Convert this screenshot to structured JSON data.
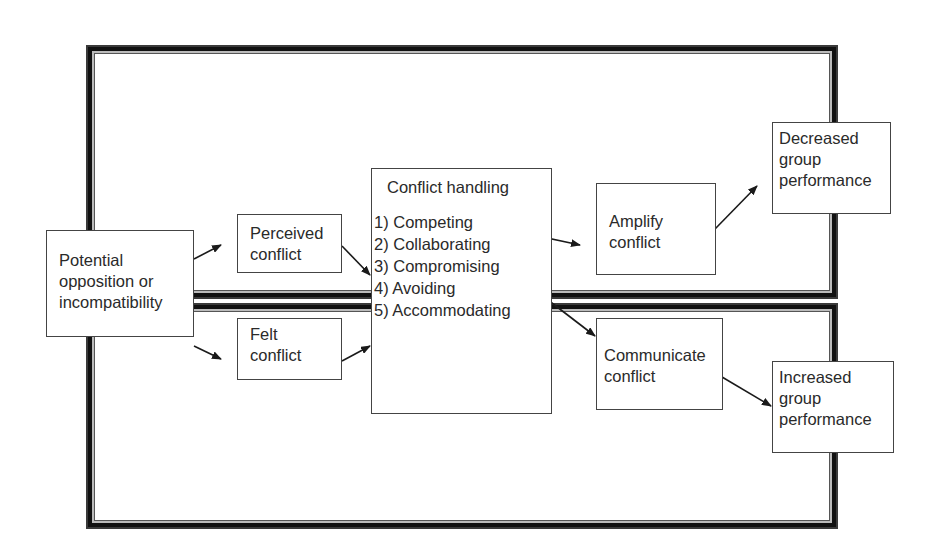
{
  "diagram": {
    "regions": [
      {
        "id": "top",
        "name": "dysfunctional-region"
      },
      {
        "id": "bottom",
        "name": "functional-region"
      }
    ],
    "nodes": {
      "potential": {
        "lines": [
          "Potential",
          "opposition or",
          "incompatibility"
        ]
      },
      "perceived": {
        "lines": [
          "Perceived",
          "conflict"
        ]
      },
      "felt": {
        "lines": [
          "Felt",
          "conflict"
        ]
      },
      "handling": {
        "title": "Conflict handling",
        "items": [
          "1) Competing",
          "2) Collaborating",
          "3) Compromising",
          "4) Avoiding",
          "5) Accommodating"
        ]
      },
      "amplify": {
        "lines": [
          "Amplify",
          "conflict"
        ]
      },
      "communicate": {
        "lines": [
          "Communicate",
          "conflict"
        ]
      },
      "decreased": {
        "lines": [
          "Decreased",
          "group",
          "performance"
        ]
      },
      "increased": {
        "lines": [
          "Increased",
          "group",
          "performance"
        ]
      }
    },
    "edges": [
      {
        "from": "potential",
        "to": "perceived"
      },
      {
        "from": "potential",
        "to": "felt"
      },
      {
        "from": "perceived",
        "to": "handling"
      },
      {
        "from": "felt",
        "to": "handling"
      },
      {
        "from": "handling.competing",
        "to": "amplify"
      },
      {
        "from": "handling.compromising",
        "to": "communicate"
      },
      {
        "from": "amplify",
        "to": "decreased"
      },
      {
        "from": "communicate",
        "to": "increased"
      }
    ],
    "colors": {
      "line": "#1a1a1a",
      "frame": "#111111",
      "text": "#2a2a2a",
      "background": "#ffffff"
    }
  }
}
